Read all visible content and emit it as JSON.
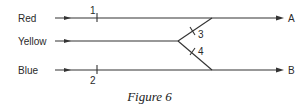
{
  "diagram": {
    "inputs": [
      {
        "label": "Red",
        "y": 18
      },
      {
        "label": "Yellow",
        "y": 41
      },
      {
        "label": "Blue",
        "y": 70
      }
    ],
    "outputs": [
      {
        "label": "A",
        "y": 18
      },
      {
        "label": "B",
        "y": 70
      }
    ],
    "markers": [
      {
        "label": "1",
        "on": "Red"
      },
      {
        "label": "2",
        "on": "Blue"
      },
      {
        "label": "3",
        "on": "Yellow-to-A branch"
      },
      {
        "label": "4",
        "on": "Yellow-to-B branch"
      }
    ],
    "colors": {
      "line": "#333333",
      "text": "#2a2a2a"
    }
  },
  "caption": "Figure 6"
}
